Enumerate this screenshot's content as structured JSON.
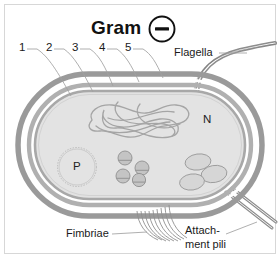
{
  "figure": {
    "title": "Gram",
    "gram_symbol": "minus-sign",
    "gram_symbol_glyph": "–"
  },
  "callout_numbers": [
    {
      "id": "1",
      "label": "1"
    },
    {
      "id": "2",
      "label": "2"
    },
    {
      "id": "3",
      "label": "3"
    },
    {
      "id": "4",
      "label": "4"
    },
    {
      "id": "5",
      "label": "5"
    }
  ],
  "labels": {
    "flagella": "Flagella",
    "fimbriae": "Fimbriae",
    "attachment_pili_line1": "Attach-",
    "attachment_pili_line2": "ment pili"
  },
  "organelles": {
    "nucleoid": "N",
    "plasmid": "P"
  },
  "colors": {
    "frame": "#d7d7d7",
    "outer_membrane": "#9a9a9a",
    "peptidoglycan": "#b4b4b4",
    "inner_membrane": "#a2a2a2",
    "cytoplasm": "#e0e0e0",
    "organelle_fill": "#c8c8c8",
    "organelle_stroke": "#8c8c8c",
    "leader_line": "#9d9d9d",
    "text": "#1a1a1a",
    "background": "#ffffff"
  },
  "counts": {
    "ribosomes": 4,
    "inclusions": 3,
    "fimbriae_strands": 9,
    "attachment_pili": 2,
    "flagella": 1
  }
}
